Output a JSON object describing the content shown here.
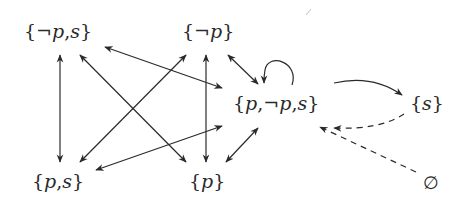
{
  "diagram": {
    "type": "state-transition-graph",
    "nodes": [
      {
        "id": "neg_p_s",
        "label": "{¬p, s}"
      },
      {
        "id": "neg_p",
        "label": "{¬p}"
      },
      {
        "id": "p_neg_p_s",
        "label": "{p, ¬p, s}"
      },
      {
        "id": "s",
        "label": "{s}"
      },
      {
        "id": "p_s",
        "label": "{p, s}"
      },
      {
        "id": "p",
        "label": "{p}"
      },
      {
        "id": "empty",
        "label": "∅"
      }
    ],
    "edges": [
      {
        "from": "neg_p_s",
        "to": "p_s",
        "style": "solid",
        "direction": "both"
      },
      {
        "from": "neg_p_s",
        "to": "p",
        "style": "solid",
        "direction": "both"
      },
      {
        "from": "neg_p_s",
        "to": "p_neg_p_s",
        "style": "solid",
        "direction": "both"
      },
      {
        "from": "neg_p",
        "to": "p_s",
        "style": "solid",
        "direction": "both"
      },
      {
        "from": "neg_p",
        "to": "p",
        "style": "solid",
        "direction": "both"
      },
      {
        "from": "neg_p",
        "to": "p_neg_p_s",
        "style": "solid",
        "direction": "both"
      },
      {
        "from": "p_s",
        "to": "p_neg_p_s",
        "style": "solid",
        "direction": "both"
      },
      {
        "from": "p",
        "to": "p_neg_p_s",
        "style": "solid",
        "direction": "both"
      },
      {
        "from": "p_neg_p_s",
        "to": "p_neg_p_s",
        "style": "solid",
        "direction": "self-loop"
      },
      {
        "from": "p_neg_p_s",
        "to": "s",
        "style": "solid",
        "direction": "forward",
        "curved": true
      },
      {
        "from": "s",
        "to": "p_neg_p_s",
        "style": "dashed",
        "direction": "forward",
        "curved": true
      },
      {
        "from": "empty",
        "to": "p_neg_p_s",
        "style": "dashed",
        "direction": "forward"
      }
    ]
  },
  "labels": {
    "neg_p_s": {
      "open": "{",
      "neg": "¬",
      "v1": "p",
      "sep": ",",
      "v2": "s",
      "close": "}"
    },
    "neg_p": {
      "open": "{",
      "neg": "¬",
      "v1": "p",
      "close": "}"
    },
    "p_neg_p_s": {
      "open": "{",
      "v1": "p",
      "sep1": ",",
      "neg": "¬",
      "v2": "p",
      "sep2": ",",
      "v3": "s",
      "close": "}"
    },
    "s": {
      "open": "{",
      "v1": "s",
      "close": "}"
    },
    "p_s": {
      "open": "{",
      "v1": "p",
      "sep": ",",
      "v2": "s",
      "close": "}"
    },
    "p": {
      "open": "{",
      "v1": "p",
      "close": "}"
    },
    "empty": {
      "symbol": "∅"
    }
  },
  "colors": {
    "ink": "#2a2a2a",
    "background": "#ffffff"
  }
}
